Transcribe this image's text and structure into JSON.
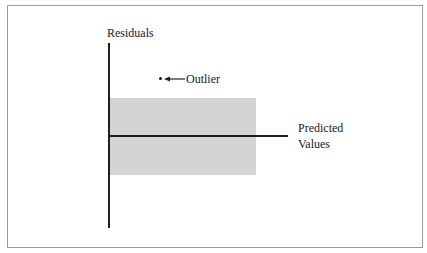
{
  "diagram": {
    "type": "residual-plot-schematic",
    "y_axis_label": "Residuals",
    "x_axis_label_line1": "Predicted",
    "x_axis_label_line2": "Values",
    "outlier_label": "Outlier",
    "band": {
      "description": "shaded region of typical residuals around zero",
      "color": "#d4d4d4"
    },
    "colors": {
      "axis": "#1f1f1f",
      "frame": "#9a9a9a",
      "background": "#ffffff",
      "text": "#1a1a1a"
    }
  }
}
